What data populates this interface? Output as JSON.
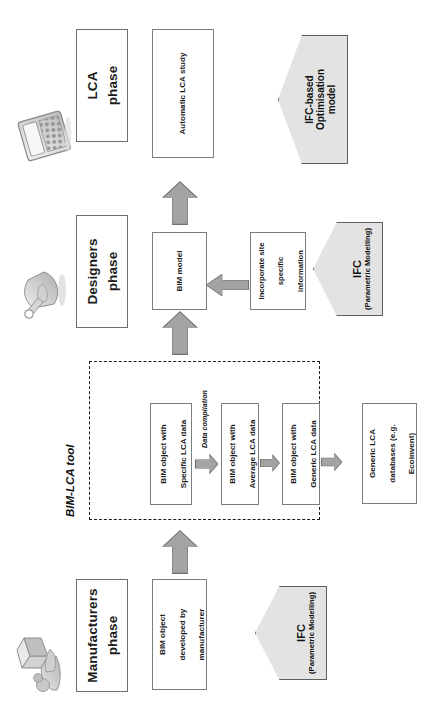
{
  "diagram": {
    "title_hidden": "BIM-LCA tool workflow",
    "tool_container_label": "BIM-LCA tool",
    "data_compilation_label": "Data compilation",
    "phases": [
      {
        "id": "manufacturers",
        "label": "Manufacturers\nphase",
        "line1": "Manufacturers",
        "line2": "phase",
        "icon": "person-with-box-icon"
      },
      {
        "id": "designers",
        "label": "Designers\nphase",
        "line1": "Designers",
        "line2": "phase",
        "icon": "hand-with-pencil-icon"
      },
      {
        "id": "lca",
        "label": "LCA\nphase",
        "line1": "LCA",
        "line2": "phase",
        "icon": "calculator-icon"
      }
    ],
    "boxes": {
      "manufacturer_object": {
        "line1": "BIM object",
        "line2": "developed by",
        "line3": "manufacturer"
      },
      "specific": {
        "line1": "BIM object with",
        "line2": "Specific LCA data"
      },
      "average": {
        "line1": "BIM object with",
        "line2": "Average LCA data"
      },
      "generic": {
        "line1": "BIM object with",
        "line2": "Generic LCA data"
      },
      "databases": {
        "line1": "Generic LCA",
        "line2": "databases (e.g.",
        "line3": "Ecoinvent)"
      },
      "bim_model": {
        "line1": "BIM model"
      },
      "site_info": {
        "line1": "Incorporate site",
        "line2": "specific information"
      },
      "automatic_lca": {
        "line1": "Automatic LCA study"
      }
    },
    "pentagons": {
      "ifc_manufacturers": {
        "title": "IFC",
        "subtitle": "(Parametric Modelling)"
      },
      "ifc_designers": {
        "title": "IFC",
        "subtitle": "(Parametric Modelling)"
      },
      "ifc_optimisation": {
        "title": "IFC-based",
        "line2": "Optimisation",
        "line3": "model"
      }
    },
    "colors": {
      "pentagon_fill": "#e3e3e3",
      "arrow_fill": "#a3a3a3",
      "arrow_stroke": "#6f6f6f",
      "box_stroke": "#7d7d7d",
      "text": "#1a1a1a"
    }
  }
}
